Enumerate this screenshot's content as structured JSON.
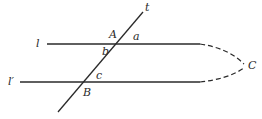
{
  "diagram": {
    "colors": {
      "stroke": "#2a2a2a",
      "background": "#ffffff"
    },
    "lines": [
      {
        "id": "l",
        "label": "l",
        "type": "solid"
      },
      {
        "id": "l_prime",
        "label": "l′",
        "type": "solid"
      },
      {
        "id": "t",
        "label": "t",
        "type": "solid"
      }
    ],
    "points": [
      {
        "id": "A",
        "label": "A"
      },
      {
        "id": "B",
        "label": "B"
      },
      {
        "id": "C",
        "label": "C"
      }
    ],
    "angles": [
      {
        "id": "a",
        "label": "a"
      },
      {
        "id": "b",
        "label": "b"
      },
      {
        "id": "c",
        "label": "c"
      }
    ]
  }
}
